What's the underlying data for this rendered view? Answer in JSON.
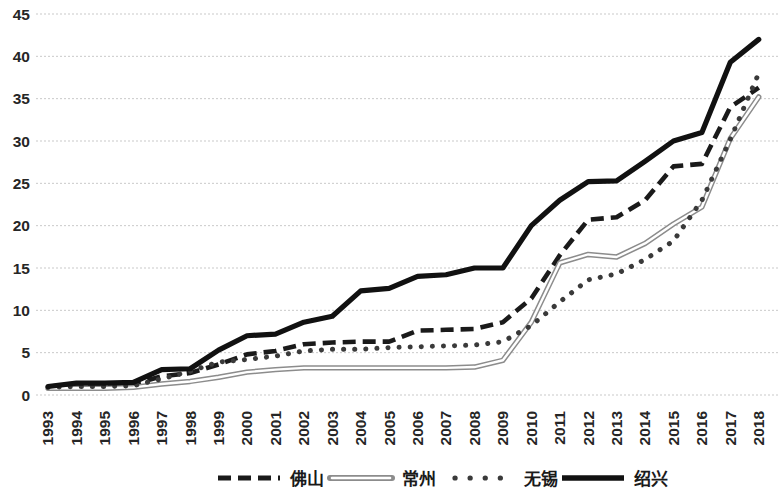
{
  "chart_data": {
    "type": "line",
    "title": "",
    "subtitle": "",
    "xlabel": "",
    "ylabel": "",
    "xlim": [
      1993,
      2018
    ],
    "ylim": [
      0,
      45
    ],
    "y_ticks": [
      0,
      5,
      10,
      15,
      20,
      25,
      30,
      35,
      40,
      45
    ],
    "grid": true,
    "grid_axis": "y",
    "legend_position": "bottom",
    "categories": [
      "1993",
      "1994",
      "1995",
      "1996",
      "1997",
      "1998",
      "1999",
      "2000",
      "2001",
      "2002",
      "2003",
      "2004",
      "2005",
      "2006",
      "2007",
      "2008",
      "2009",
      "2010",
      "2011",
      "2012",
      "2013",
      "2014",
      "2015",
      "2016",
      "2017",
      "2018"
    ],
    "series": [
      {
        "name": "佛山",
        "style": "dashed",
        "color": "#1a1a1a",
        "values": [
          1.0,
          1.2,
          1.2,
          1.3,
          2.2,
          2.6,
          3.6,
          4.8,
          5.2,
          6.0,
          6.2,
          6.3,
          6.3,
          7.6,
          7.7,
          7.8,
          8.6,
          11.4,
          16.5,
          20.7,
          21.0,
          23.0,
          27.0,
          27.3,
          34.0,
          36.3
        ]
      },
      {
        "name": "常州",
        "style": "double-hollow",
        "color": "#8c8c8c",
        "values": [
          0.8,
          0.8,
          0.8,
          0.9,
          1.3,
          1.6,
          2.1,
          2.7,
          3.0,
          3.2,
          3.2,
          3.2,
          3.2,
          3.2,
          3.2,
          3.3,
          4.1,
          8.6,
          15.6,
          16.6,
          16.3,
          17.9,
          20.2,
          22.2,
          30.3,
          35.2
        ]
      },
      {
        "name": "无锡",
        "style": "dotted",
        "color": "#3a3a3a",
        "values": [
          0.9,
          1.0,
          1.0,
          1.1,
          1.9,
          2.8,
          3.9,
          4.2,
          4.6,
          5.2,
          5.4,
          5.4,
          5.6,
          5.7,
          5.8,
          5.9,
          6.3,
          8.2,
          11.0,
          13.6,
          14.3,
          16.0,
          18.2,
          23.0,
          30.2,
          38.0
        ]
      },
      {
        "name": "绍兴",
        "style": "solid-thick",
        "color": "#111111",
        "values": [
          1.0,
          1.4,
          1.4,
          1.5,
          3.0,
          3.1,
          5.3,
          7.0,
          7.2,
          8.6,
          9.3,
          12.3,
          12.6,
          14.0,
          14.2,
          15.0,
          15.0,
          20.0,
          23.0,
          25.2,
          25.3,
          27.6,
          30.0,
          31.0,
          39.3,
          42.0
        ]
      }
    ]
  },
  "legend": {
    "items": [
      {
        "label": "佛山",
        "marker": "dashed-line"
      },
      {
        "label": "常州",
        "marker": "hollow-double-line"
      },
      {
        "label": "无锡",
        "marker": "dotted-line"
      },
      {
        "label": "绍兴",
        "marker": "solid-thick-line"
      }
    ]
  }
}
